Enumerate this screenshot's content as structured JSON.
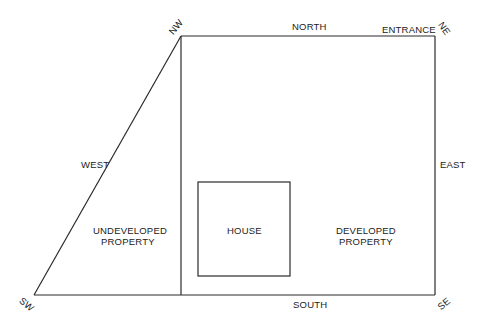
{
  "diagram": {
    "type": "property-site-plan",
    "corners": {
      "nw": "NW",
      "ne": "NE",
      "se": "SE",
      "sw": "SW"
    },
    "sides": {
      "north": "NORTH",
      "south": "SOUTH",
      "east": "EAST",
      "west": "WEST"
    },
    "entrance": "ENTRANCE",
    "regions": {
      "undeveloped": [
        "UNDEVELOPED",
        "PROPERTY"
      ],
      "house": "HOUSE",
      "developed": [
        "DEVELOPED",
        "PROPERTY"
      ]
    },
    "colors": {
      "line": "#2a2a2a",
      "text": "#222222",
      "background": "#ffffff"
    }
  }
}
